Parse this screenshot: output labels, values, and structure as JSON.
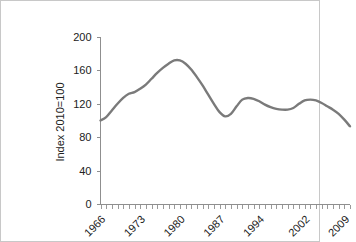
{
  "page": {
    "border_color": "#c8c8c8",
    "background": "#ffffff"
  },
  "chart_data": {
    "type": "line",
    "title": "",
    "subtitle": "",
    "xlabel": "",
    "ylabel": "Index 2010=100",
    "line_color": "#7a7a7a",
    "axis_color": "#8f8f8f",
    "grid": false,
    "legend": null,
    "legend_position": "none",
    "ylim": [
      0,
      200
    ],
    "yticks": [
      0,
      40,
      80,
      120,
      160,
      200
    ],
    "ytick_labels": [
      "0",
      "40",
      "80",
      "120",
      "160",
      "200"
    ],
    "xlim": [
      1965,
      2009
    ],
    "xticks": [
      1966,
      1973,
      1980,
      1987,
      1994,
      2002,
      2009
    ],
    "xtick_labels": [
      "1966",
      "1973",
      "1980",
      "1987",
      "1994",
      "2002",
      "2009"
    ],
    "x_minor_tick_interval": 1,
    "series": [
      {
        "name": "Index 2010=100",
        "x": [
          1965,
          1966,
          1967,
          1968,
          1969,
          1970,
          1971,
          1972,
          1973,
          1974,
          1975,
          1976,
          1977,
          1978,
          1979,
          1980,
          1981,
          1982,
          1983,
          1984,
          1985,
          1986,
          1987,
          1988,
          1989,
          1990,
          1991,
          1992,
          1993,
          1994,
          1995,
          1996,
          1997,
          1998,
          1999,
          2000,
          2001,
          2002,
          2003,
          2004,
          2005,
          2006,
          2007,
          2008,
          2009
        ],
        "values": [
          100,
          104,
          112,
          120,
          127,
          132,
          134,
          138,
          143,
          150,
          157,
          163,
          168,
          172,
          172,
          168,
          161,
          152,
          142,
          131,
          120,
          110,
          105,
          108,
          117,
          125,
          127,
          126,
          123,
          119,
          116,
          114,
          113,
          113,
          115,
          120,
          124,
          125,
          124,
          121,
          117,
          113,
          108,
          101,
          93
        ]
      }
    ]
  }
}
